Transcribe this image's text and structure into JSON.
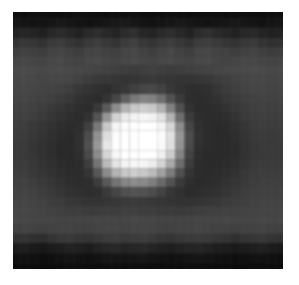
{
  "image": {
    "description": "grayscale pixelated image of a bright circular spot centered on a darker ring over a mid-gray field with dark top and bottom bands",
    "cols": 30,
    "rows": 28,
    "intensity": [
      [
        14,
        14,
        16,
        15,
        14,
        13,
        14,
        16,
        15,
        14,
        13,
        14,
        15,
        16,
        14,
        13,
        14,
        15,
        14,
        13,
        14,
        15,
        14,
        13,
        14,
        15,
        14,
        13,
        14,
        14
      ],
      [
        22,
        20,
        18,
        20,
        22,
        24,
        22,
        20,
        18,
        20,
        22,
        24,
        26,
        22,
        20,
        18,
        20,
        22,
        24,
        22,
        20,
        18,
        20,
        22,
        24,
        22,
        20,
        18,
        20,
        22
      ],
      [
        34,
        38,
        36,
        32,
        40,
        44,
        38,
        34,
        42,
        46,
        40,
        36,
        44,
        48,
        38,
        36,
        42,
        46,
        40,
        34,
        44,
        48,
        42,
        38,
        34,
        40,
        42,
        36,
        32,
        34
      ],
      [
        52,
        56,
        54,
        50,
        58,
        60,
        54,
        50,
        58,
        62,
        56,
        52,
        60,
        64,
        56,
        52,
        58,
        62,
        56,
        50,
        60,
        62,
        58,
        54,
        50,
        56,
        58,
        52,
        48,
        50
      ],
      [
        62,
        66,
        64,
        62,
        68,
        70,
        66,
        62,
        68,
        70,
        66,
        64,
        70,
        72,
        66,
        62,
        68,
        72,
        66,
        62,
        70,
        72,
        68,
        66,
        62,
        66,
        68,
        64,
        60,
        62
      ],
      [
        70,
        72,
        70,
        68,
        72,
        74,
        70,
        68,
        72,
        74,
        70,
        68,
        72,
        74,
        70,
        68,
        72,
        74,
        70,
        68,
        72,
        74,
        70,
        68,
        70,
        72,
        72,
        70,
        68,
        70
      ],
      [
        74,
        76,
        74,
        72,
        74,
        76,
        74,
        72,
        70,
        68,
        66,
        64,
        62,
        60,
        62,
        64,
        62,
        60,
        62,
        64,
        66,
        68,
        70,
        72,
        74,
        74,
        76,
        74,
        72,
        74
      ],
      [
        72,
        74,
        72,
        70,
        72,
        72,
        70,
        66,
        62,
        58,
        56,
        54,
        52,
        54,
        56,
        58,
        56,
        54,
        52,
        52,
        54,
        56,
        60,
        64,
        68,
        70,
        72,
        72,
        70,
        72
      ],
      [
        70,
        72,
        70,
        68,
        68,
        66,
        62,
        56,
        52,
        48,
        46,
        50,
        56,
        64,
        70,
        72,
        66,
        56,
        50,
        46,
        46,
        48,
        54,
        60,
        64,
        68,
        70,
        70,
        68,
        70
      ],
      [
        68,
        70,
        68,
        66,
        64,
        60,
        56,
        50,
        46,
        44,
        52,
        70,
        96,
        120,
        132,
        128,
        110,
        82,
        58,
        46,
        44,
        46,
        50,
        56,
        60,
        64,
        66,
        68,
        66,
        68
      ],
      [
        66,
        68,
        66,
        62,
        58,
        54,
        50,
        46,
        44,
        56,
        90,
        140,
        180,
        200,
        206,
        200,
        178,
        130,
        80,
        50,
        44,
        44,
        46,
        50,
        56,
        60,
        64,
        66,
        64,
        66
      ],
      [
        64,
        66,
        62,
        58,
        54,
        50,
        46,
        44,
        50,
        84,
        150,
        210,
        236,
        244,
        246,
        242,
        226,
        180,
        110,
        60,
        46,
        44,
        44,
        46,
        52,
        58,
        62,
        64,
        62,
        64
      ],
      [
        62,
        62,
        58,
        54,
        50,
        46,
        44,
        46,
        64,
        120,
        200,
        246,
        254,
        255,
        255,
        254,
        246,
        214,
        140,
        70,
        48,
        44,
        42,
        44,
        48,
        54,
        60,
        62,
        60,
        62
      ],
      [
        60,
        60,
        56,
        52,
        48,
        44,
        42,
        48,
        76,
        144,
        222,
        252,
        255,
        255,
        255,
        255,
        252,
        226,
        150,
        76,
        50,
        44,
        42,
        42,
        46,
        52,
        58,
        60,
        58,
        60
      ],
      [
        58,
        58,
        54,
        50,
        46,
        42,
        42,
        48,
        80,
        152,
        230,
        254,
        255,
        255,
        255,
        255,
        250,
        222,
        146,
        74,
        48,
        44,
        42,
        42,
        44,
        50,
        56,
        58,
        58,
        58
      ],
      [
        58,
        58,
        54,
        50,
        46,
        42,
        42,
        46,
        74,
        140,
        214,
        248,
        255,
        255,
        255,
        254,
        240,
        204,
        132,
        68,
        46,
        42,
        42,
        42,
        44,
        50,
        56,
        58,
        58,
        58
      ],
      [
        60,
        60,
        56,
        52,
        48,
        44,
        42,
        44,
        62,
        116,
        186,
        228,
        244,
        248,
        246,
        236,
        212,
        170,
        110,
        60,
        44,
        42,
        42,
        44,
        46,
        52,
        58,
        60,
        60,
        60
      ],
      [
        62,
        62,
        58,
        54,
        50,
        46,
        44,
        44,
        52,
        86,
        140,
        180,
        200,
        206,
        200,
        186,
        160,
        124,
        80,
        52,
        44,
        42,
        44,
        46,
        50,
        56,
        60,
        62,
        62,
        62
      ],
      [
        64,
        66,
        62,
        58,
        54,
        50,
        46,
        44,
        46,
        60,
        88,
        116,
        134,
        140,
        138,
        126,
        106,
        82,
        58,
        46,
        42,
        44,
        46,
        50,
        54,
        58,
        62,
        64,
        64,
        64
      ],
      [
        66,
        68,
        66,
        62,
        58,
        54,
        50,
        48,
        46,
        48,
        58,
        70,
        80,
        84,
        82,
        76,
        66,
        54,
        48,
        44,
        46,
        48,
        50,
        54,
        58,
        62,
        64,
        66,
        66,
        66
      ],
      [
        68,
        70,
        68,
        66,
        62,
        60,
        56,
        54,
        52,
        52,
        54,
        56,
        58,
        60,
        58,
        56,
        54,
        52,
        50,
        50,
        52,
        54,
        56,
        60,
        62,
        64,
        66,
        68,
        68,
        68
      ],
      [
        70,
        72,
        70,
        68,
        66,
        64,
        62,
        62,
        60,
        60,
        62,
        62,
        64,
        64,
        62,
        62,
        60,
        60,
        58,
        60,
        62,
        64,
        64,
        66,
        66,
        68,
        68,
        70,
        70,
        70
      ],
      [
        72,
        72,
        70,
        70,
        70,
        68,
        68,
        68,
        68,
        70,
        70,
        70,
        70,
        72,
        70,
        70,
        68,
        68,
        68,
        68,
        70,
        70,
        70,
        72,
        70,
        70,
        70,
        72,
        70,
        72
      ],
      [
        66,
        68,
        66,
        64,
        66,
        68,
        68,
        66,
        66,
        68,
        70,
        70,
        68,
        70,
        70,
        68,
        66,
        66,
        68,
        68,
        70,
        68,
        66,
        66,
        64,
        66,
        66,
        68,
        66,
        66
      ],
      [
        50,
        52,
        48,
        46,
        52,
        56,
        58,
        54,
        52,
        56,
        60,
        62,
        58,
        60,
        62,
        58,
        54,
        52,
        56,
        58,
        60,
        58,
        54,
        52,
        48,
        52,
        54,
        56,
        52,
        50
      ],
      [
        28,
        30,
        26,
        24,
        28,
        30,
        34,
        32,
        28,
        34,
        38,
        40,
        36,
        38,
        40,
        36,
        32,
        30,
        34,
        36,
        38,
        34,
        30,
        28,
        26,
        28,
        30,
        32,
        28,
        26
      ],
      [
        16,
        18,
        16,
        14,
        16,
        18,
        20,
        18,
        16,
        18,
        22,
        22,
        20,
        22,
        24,
        20,
        18,
        16,
        18,
        20,
        22,
        20,
        18,
        16,
        14,
        16,
        18,
        18,
        16,
        14
      ],
      [
        12,
        13,
        12,
        11,
        12,
        13,
        14,
        13,
        12,
        13,
        14,
        14,
        13,
        14,
        15,
        13,
        12,
        12,
        13,
        14,
        14,
        13,
        12,
        12,
        11,
        12,
        13,
        13,
        12,
        11
      ]
    ]
  }
}
